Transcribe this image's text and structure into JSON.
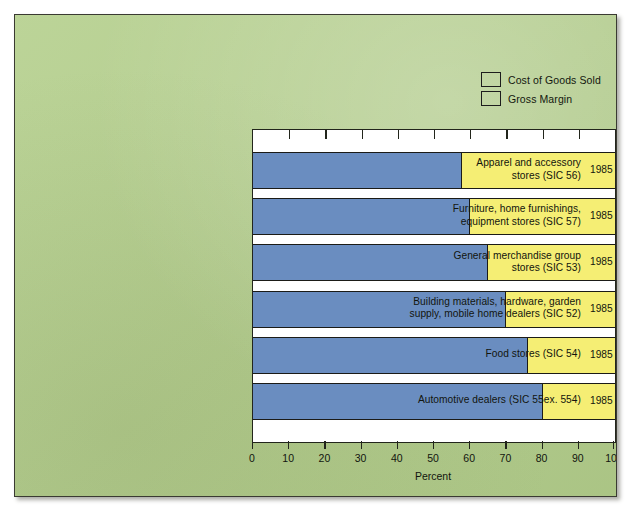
{
  "figure": {
    "background_color": "#b4cf8c",
    "plot_background": "#ffffff"
  },
  "legend": {
    "position": "top-right",
    "items": [
      {
        "label": "Cost of Goods Sold",
        "color": "#6a8dc0"
      },
      {
        "label": "Gross Margin",
        "color": "#f5ee74"
      }
    ]
  },
  "axis": {
    "title": "Percent",
    "ticks": [
      "0",
      "10",
      "20",
      "30",
      "40",
      "50",
      "60",
      "70",
      "80",
      "90",
      "100"
    ]
  },
  "rows": [
    {
      "name": "Apparel and accessory\nstores (SIC 56)",
      "year": "1985"
    },
    {
      "name": "Furniture, home furnishings,\nequipment stores (SIC 57)",
      "year": "1985"
    },
    {
      "name": "General merchandise group\nstores (SIC 53)",
      "year": "1985"
    },
    {
      "name": "Building materials, hardware, garden\nsupply, mobile home dealers (SIC 52)",
      "year": "1985"
    },
    {
      "name": "Food stores (SIC 54)",
      "year": "1985"
    },
    {
      "name": "Automotive dealers (SIC 55ex. 554)",
      "year": "1985"
    }
  ],
  "chart_data": {
    "type": "bar",
    "orientation": "horizontal",
    "stacked": true,
    "title": "",
    "xlabel": "Percent",
    "ylabel": "",
    "xlim": [
      0,
      100
    ],
    "xticks": [
      0,
      10,
      20,
      30,
      40,
      50,
      60,
      70,
      80,
      90,
      100
    ],
    "grid": false,
    "legend_position": "top-right",
    "categories": [
      "Apparel and accessory stores (SIC 56)",
      "Furniture, home furnishings, equipment stores (SIC 57)",
      "General merchandise group stores (SIC 53)",
      "Building materials, hardware, garden supply, mobile home dealers (SIC 52)",
      "Food stores (SIC 54)",
      "Automotive dealers (SIC 55ex. 554)"
    ],
    "year": "1985",
    "series": [
      {
        "name": "Cost of Goods Sold",
        "color": "#6a8dc0",
        "values": [
          57.7,
          60.0,
          65.0,
          70.0,
          76.0,
          80.0
        ]
      },
      {
        "name": "Gross Margin",
        "color": "#f5ee74",
        "values": [
          42.3,
          40.0,
          35.0,
          30.0,
          24.0,
          20.0
        ]
      }
    ]
  }
}
